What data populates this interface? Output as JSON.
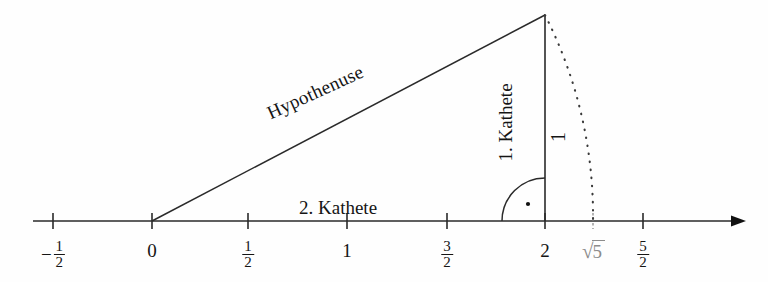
{
  "figure": {
    "background_color": "#fefefe",
    "ink_color": "#151515",
    "muted_color": "#8c8c8c"
  },
  "axis": {
    "name": "number-line",
    "arrow": "right-arrow",
    "ticks": [
      {
        "id": "tick-neg-half",
        "x": 53,
        "value": -0.5,
        "label_kind": "fraction",
        "sign": "−",
        "numerator": "1",
        "denominator": "2",
        "muted": false,
        "dashed": false
      },
      {
        "id": "tick-zero",
        "x": 152,
        "value": 0,
        "label_kind": "plain",
        "text": "0",
        "muted": false,
        "dashed": false
      },
      {
        "id": "tick-half",
        "x": 248,
        "value": 0.5,
        "label_kind": "fraction",
        "sign": "",
        "numerator": "1",
        "denominator": "2",
        "muted": false,
        "dashed": false
      },
      {
        "id": "tick-one",
        "x": 347,
        "value": 1,
        "label_kind": "plain",
        "text": "1",
        "muted": false,
        "dashed": false
      },
      {
        "id": "tick-three-halves",
        "x": 447,
        "value": 1.5,
        "label_kind": "fraction",
        "sign": "",
        "numerator": "3",
        "denominator": "2",
        "muted": false,
        "dashed": false
      },
      {
        "id": "tick-two",
        "x": 545,
        "value": 2,
        "label_kind": "plain",
        "text": "2",
        "muted": false,
        "dashed": false
      },
      {
        "id": "tick-sqrt5",
        "x": 593,
        "value": 2.236,
        "label_kind": "sqrt",
        "radicand": "5",
        "muted": true,
        "dashed": true
      },
      {
        "id": "tick-five-halves",
        "x": 643,
        "value": 2.5,
        "label_kind": "fraction",
        "sign": "",
        "numerator": "5",
        "denominator": "2",
        "muted": false,
        "dashed": false
      }
    ]
  },
  "triangle": {
    "vertices": {
      "origin": {
        "x": 152,
        "y": 221,
        "name": "vertex-origin"
      },
      "right_angle": {
        "x": 545,
        "y": 221,
        "name": "vertex-right-angle"
      },
      "apex": {
        "x": 545,
        "y": 15,
        "name": "vertex-apex"
      }
    },
    "edges": {
      "hypotenuse_label": "Hypothenuse",
      "kathete_1_label": "1. Kathete",
      "kathete_2_label": "2. Kathete"
    },
    "right_angle_marker": "quarter-arc-with-dot"
  },
  "arc": {
    "name": "dotted-radius-arc",
    "label": "1",
    "center_x": 152,
    "center_y": 221,
    "from": {
      "x": 545,
      "y": 15
    },
    "to": {
      "x": 593,
      "y": 221
    },
    "style": "dotted"
  }
}
